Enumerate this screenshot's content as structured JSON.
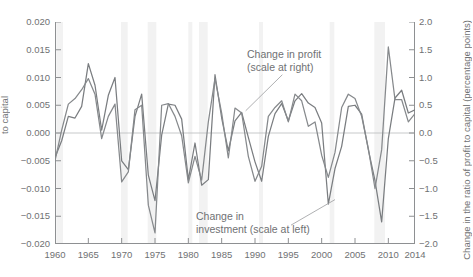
{
  "chart_data": {
    "type": "line",
    "title": "",
    "xlabel": "",
    "ylabel_left": "to capital",
    "ylabel_right": "Change in the ratio of profit to capital (percentage points)",
    "xlim": [
      1960,
      2014
    ],
    "ylim_left": [
      -0.02,
      0.02
    ],
    "ylim_right": [
      -2.0,
      2.0
    ],
    "grid": false,
    "legend_position": "inline-annotations",
    "xticks": [
      "1960",
      "1965",
      "1970",
      "1975",
      "1980",
      "1985",
      "1990",
      "1995",
      "2000",
      "2005",
      "2010",
      "2014"
    ],
    "xtick_values": [
      1960,
      1965,
      1970,
      1975,
      1980,
      1985,
      1990,
      1995,
      2000,
      2005,
      2010,
      2014
    ],
    "yticks_left": [
      "0.020",
      "0.015",
      "0.010",
      "0.005",
      "0.000",
      "−0.005",
      "−0.010",
      "−0.015",
      "−0.020"
    ],
    "ytick_values_left": [
      0.02,
      0.015,
      0.01,
      0.005,
      0.0,
      -0.005,
      -0.01,
      -0.015,
      -0.02
    ],
    "yticks_right": [
      "2.0",
      "1.5",
      "1.0",
      "0.5",
      "0.0",
      "−0.5",
      "−1.0",
      "−1.5",
      "−2.0"
    ],
    "ytick_values_right": [
      2.0,
      1.5,
      1.0,
      0.5,
      0.0,
      -0.5,
      -1.0,
      -1.5,
      -2.0
    ],
    "annotations": [
      {
        "id": "profit",
        "line1": "Change in profit",
        "line2": "(scale at right)"
      },
      {
        "id": "investment",
        "line1": "Change in",
        "line2": "investment (scale at left)"
      }
    ],
    "recession_bands": [
      [
        1960.2,
        1961.2
      ],
      [
        1969.9,
        1970.9
      ],
      [
        1973.9,
        1975.2
      ],
      [
        1980.0,
        1980.6
      ],
      [
        1981.6,
        1982.9
      ],
      [
        1990.6,
        1991.2
      ],
      [
        2001.2,
        2001.9
      ],
      [
        2007.9,
        2009.5
      ]
    ],
    "x": [
      1960,
      1961,
      1962,
      1963,
      1964,
      1965,
      1966,
      1967,
      1968,
      1969,
      1970,
      1971,
      1972,
      1973,
      1974,
      1975,
      1976,
      1977,
      1978,
      1979,
      1980,
      1981,
      1982,
      1983,
      1984,
      1985,
      1986,
      1987,
      1988,
      1989,
      1990,
      1991,
      1992,
      1993,
      1994,
      1995,
      1996,
      1997,
      1998,
      1999,
      2000,
      2001,
      2002,
      2003,
      2004,
      2005,
      2006,
      2007,
      2008,
      2009,
      2010,
      2011,
      2012,
      2013,
      2014
    ],
    "series": [
      {
        "name": "Change in investment (scale at left)",
        "axis": "left",
        "color": "#7a7d80",
        "values": [
          -0.0044,
          -0.0014,
          0.003,
          0.0027,
          0.0048,
          0.0125,
          0.0086,
          0.0005,
          0.0068,
          0.01,
          -0.005,
          -0.0066,
          0.003,
          0.007,
          -0.0076,
          -0.0122,
          -0.0004,
          0.0052,
          0.005,
          0.0025,
          -0.0084,
          -0.0018,
          -0.0094,
          -0.0084,
          0.0105,
          0.0027,
          -0.0032,
          0.0022,
          0.0037,
          -0.0008,
          -0.0052,
          -0.0087,
          -0.0006,
          0.0035,
          0.0053,
          0.0022,
          0.0058,
          0.0071,
          0.0054,
          0.0046,
          0.0018,
          -0.0128,
          -0.0064,
          -0.0024,
          0.0048,
          0.005,
          0.0034,
          -0.003,
          -0.0086,
          -0.016,
          -0.001,
          0.0063,
          0.0077,
          0.0036,
          0.0042
        ]
      },
      {
        "name": "Change in profit (scale at right)",
        "axis": "right",
        "color": "#86898c",
        "values": [
          -0.5,
          0.05,
          0.52,
          0.62,
          0.78,
          0.98,
          0.7,
          -0.1,
          0.3,
          0.52,
          -0.88,
          -0.7,
          0.42,
          0.5,
          -1.3,
          -1.8,
          0.5,
          0.53,
          0.3,
          -0.05,
          -0.9,
          -0.42,
          -0.85,
          0.2,
          0.98,
          0.36,
          -0.45,
          0.45,
          0.36,
          -0.42,
          -0.87,
          -0.6,
          0.3,
          0.46,
          0.58,
          0.2,
          0.7,
          0.58,
          0.12,
          0.2,
          -0.4,
          -0.8,
          -0.35,
          0.46,
          0.7,
          0.62,
          0.3,
          -0.28,
          -1.0,
          -0.3,
          1.55,
          0.6,
          0.6,
          0.2,
          0.35
        ]
      }
    ]
  }
}
